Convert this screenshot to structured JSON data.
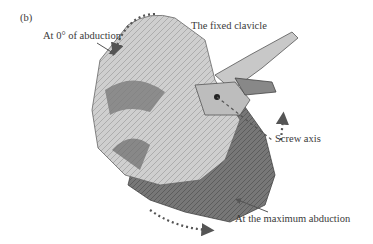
{
  "panel_label": "(b)",
  "labels": {
    "zero_abduction": "At 0° of abduction",
    "fixed_clavicle": "The fixed clavicle",
    "screw_axis": "Screw axis",
    "max_abduction": "At the maximum abduction"
  },
  "colors": {
    "background": "#ffffff",
    "bone_light": "#d8d8d8",
    "bone_mid": "#9a9a9a",
    "bone_dark": "#5e5e5e",
    "arrow": "#555555"
  }
}
